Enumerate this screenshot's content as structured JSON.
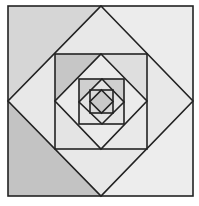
{
  "figure": {
    "stroke_color": "#222222",
    "fills": {
      "outer_top_left": "#d6d6d6",
      "outer_bottom_left": "#c3c3c3",
      "outer_top_right": "#ececec",
      "outer_bottom_right": "#ededed",
      "diamond1_base": "#e8e8e8",
      "sq2_top_left": "#c6c6c6",
      "sq2_bottom_left": "#e4e4e4",
      "sq2_top_right": "#dedede",
      "sq2_bottom_right": "#e9e9e9",
      "diamond2_base": "#ebebeb",
      "sq3_top_left": "#cfcfcf",
      "sq3_other": "#e6e6e6",
      "diamond3_base": "#e3e3e3",
      "sq4_corners": "#dadada",
      "diamond4_base": "#c9c9c9"
    }
  }
}
